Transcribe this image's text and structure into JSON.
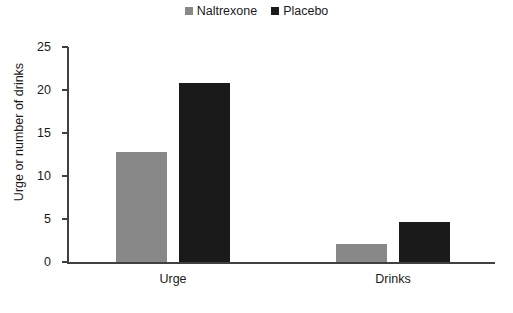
{
  "chart_data": {
    "type": "bar",
    "title": "",
    "xlabel": "",
    "ylabel": "Urge or number of drinks",
    "categories": [
      "Urge",
      "Drinks"
    ],
    "series": [
      {
        "name": "Naltrexone",
        "color": "#888888",
        "values": [
          12.8,
          2.1
        ]
      },
      {
        "name": "Placebo",
        "color": "#1a1a1a",
        "values": [
          20.8,
          4.7
        ]
      }
    ],
    "ylim": [
      0,
      25
    ],
    "yticks": [
      0,
      5,
      10,
      15,
      20,
      25
    ],
    "ytick_labels": [
      "0",
      "5",
      "10",
      "15",
      "20",
      "25"
    ],
    "grid": false,
    "legend_position": "top-center"
  },
  "legend": {
    "entries": [
      {
        "label": "Naltrexone",
        "swatch": "legend-swatch-naltrexone"
      },
      {
        "label": "Placebo",
        "swatch": "legend-swatch-placebo"
      }
    ]
  }
}
